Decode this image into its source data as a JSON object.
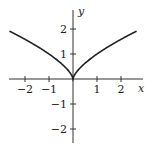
{
  "chart_data": {
    "type": "line",
    "title": "",
    "xlabel": "x",
    "ylabel": "y",
    "function": "y = |x|^(2/3)",
    "xlim": [
      -2.65,
      2.65
    ],
    "ylim": [
      -2.6,
      2.7
    ],
    "grid": false,
    "legend": null,
    "x_ticks": [
      -2,
      -1,
      1,
      2
    ],
    "y_ticks": [
      2,
      1,
      -1,
      -2
    ],
    "x_tick_labels": [
      "−2",
      "−1",
      "1",
      "2"
    ],
    "y_tick_labels": [
      "2",
      "1",
      "−1",
      "−2"
    ],
    "series": [
      {
        "name": "curve",
        "x": [
          -2.65,
          -2,
          -1.5,
          -1,
          -0.5,
          -0.25,
          -0.1,
          0,
          0.1,
          0.25,
          0.5,
          1,
          1.5,
          2,
          2.65
        ],
        "y": [
          1.92,
          1.59,
          1.31,
          1.0,
          0.63,
          0.4,
          0.22,
          0,
          0.22,
          0.4,
          0.63,
          1.0,
          1.31,
          1.59,
          1.92
        ]
      }
    ],
    "colors": {
      "curve": "#222222",
      "axes": "#333333"
    }
  }
}
